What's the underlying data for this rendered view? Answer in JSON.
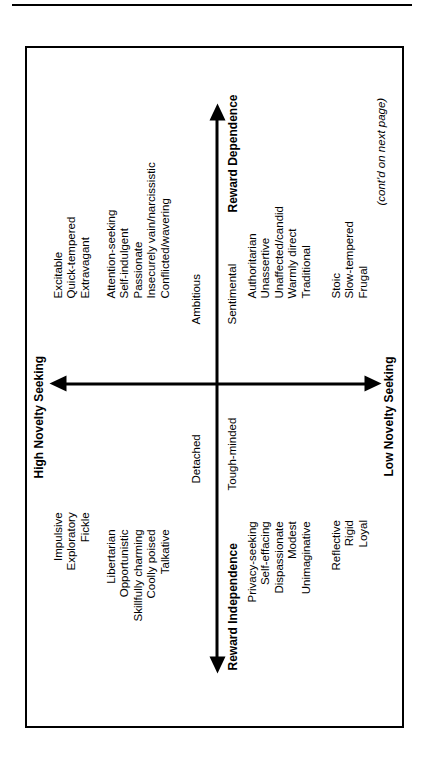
{
  "page": {
    "continuation_note": "(cont'd on next page)"
  },
  "axes": {
    "vertical": {
      "top_title": "High Novelty Seeking",
      "bottom_title": "Low Novelty Seeking"
    },
    "horizontal": {
      "left_title": "Reward Independence",
      "right_title": "Reward Dependence",
      "left_pole_upper": "Detached",
      "left_pole_lower": "Tough-minded",
      "right_pole_upper": "Ambitious",
      "right_pole_lower": "Sentimental"
    }
  },
  "groups": {
    "upper_left_traits": "Impulsive\nExploratory\nFickle",
    "upper_right_traits": "Excitable\nQuick-tempered\nExtravagant",
    "quadrant_high_independence": "Libertarian\nOpportunistic\nSkillfully charming\nCoolly poised\nTalkative",
    "quadrant_high_dependence": "Attention-seeking\nSelf-indulgent\nPassionate\nInsecurely vain/narcissistic\nConflicted/wavering",
    "quadrant_low_independence": "Privacy-seeking\nSelf-effacing\nDispassionate\nModest\nUnimaginative",
    "quadrant_low_dependence": "Authoritarian\nUnassertive\nUnaffected/candid\nWarmly direct\nTraditional",
    "lower_left_traits": "Reflective\nRigid\nLoyal",
    "lower_right_traits": "Stoic\nSlow-tempered\nFrugal"
  },
  "colors": {
    "ink": "#000000",
    "paper": "#ffffff"
  }
}
